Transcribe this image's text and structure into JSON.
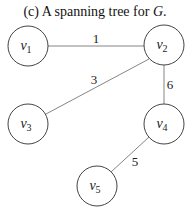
{
  "title": {
    "prefix": "(c) A spanning tree for ",
    "graph": "G",
    "suffix": "."
  },
  "nodes": [
    {
      "id": "v1",
      "base": "v",
      "sub": "1",
      "x": 28,
      "y": 46
    },
    {
      "id": "v2",
      "base": "v",
      "sub": "2",
      "x": 164,
      "y": 45
    },
    {
      "id": "v3",
      "base": "v",
      "sub": "3",
      "x": 28,
      "y": 124
    },
    {
      "id": "v4",
      "base": "v",
      "sub": "4",
      "x": 164,
      "y": 124
    },
    {
      "id": "v5",
      "base": "v",
      "sub": "5",
      "x": 97,
      "y": 186
    }
  ],
  "edges": [
    {
      "from": "v1",
      "to": "v2",
      "weight": "1"
    },
    {
      "from": "v2",
      "to": "v3",
      "weight": "3"
    },
    {
      "from": "v2",
      "to": "v4",
      "weight": "6"
    },
    {
      "from": "v4",
      "to": "v5",
      "weight": "5"
    }
  ],
  "style": {
    "stroke": "#444444",
    "edge": "#777777",
    "radius": 20
  }
}
